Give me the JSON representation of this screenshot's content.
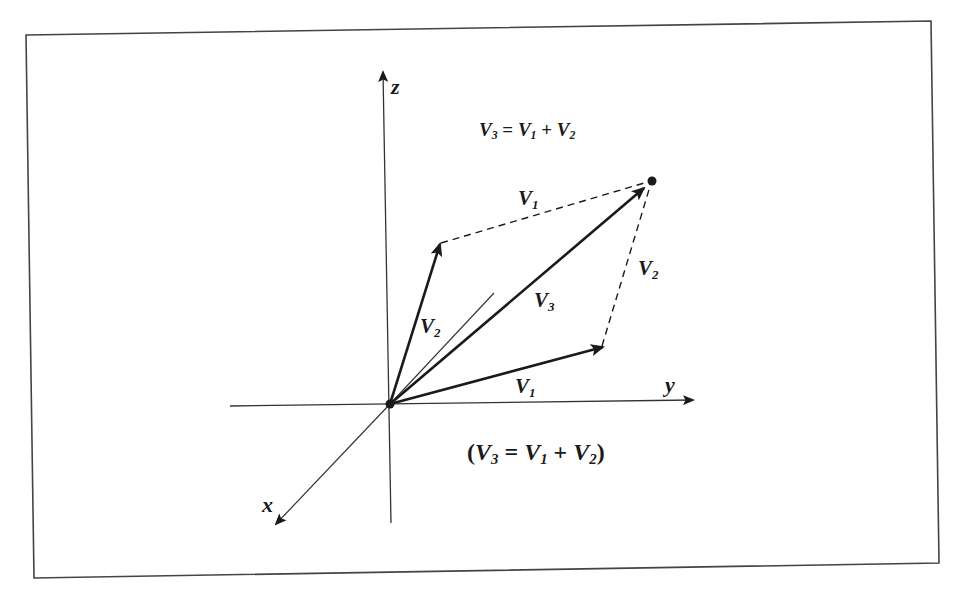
{
  "diagram": {
    "title_equation": {
      "lhs": "V",
      "lhs_sub": "3",
      "eq": " = ",
      "t1": "V",
      "t1_sub": "1",
      "plus": " + ",
      "t2": "V",
      "t2_sub": "2"
    },
    "caption_equation": {
      "open": "(",
      "lhs": "V",
      "lhs_sub": "3",
      "eq": " = ",
      "t1": "V",
      "t1_sub": "1",
      "plus": " + ",
      "t2": "V",
      "t2_sub": "2",
      "close": ")"
    },
    "axes": {
      "x": {
        "label": "x"
      },
      "y": {
        "label": "y"
      },
      "z": {
        "label": "z"
      }
    },
    "vectors": [
      {
        "id": "V1",
        "label": "V",
        "sub": "1",
        "style": "solid",
        "from": "origin",
        "to": "p1"
      },
      {
        "id": "V2",
        "label": "V",
        "sub": "2",
        "style": "solid",
        "from": "origin",
        "to": "p2"
      },
      {
        "id": "V3",
        "label": "V",
        "sub": "3",
        "style": "solid",
        "from": "origin",
        "to": "p3"
      },
      {
        "id": "V1-translated",
        "label": "V",
        "sub": "1",
        "style": "dashed",
        "from": "p2",
        "to": "p3"
      },
      {
        "id": "V2-translated",
        "label": "V",
        "sub": "2",
        "style": "dashed",
        "from": "p1",
        "to": "p3"
      }
    ],
    "colors": {
      "ink": "#1a1a1a",
      "axis": "#333333",
      "frame": "#444444",
      "background": "#ffffff"
    }
  }
}
